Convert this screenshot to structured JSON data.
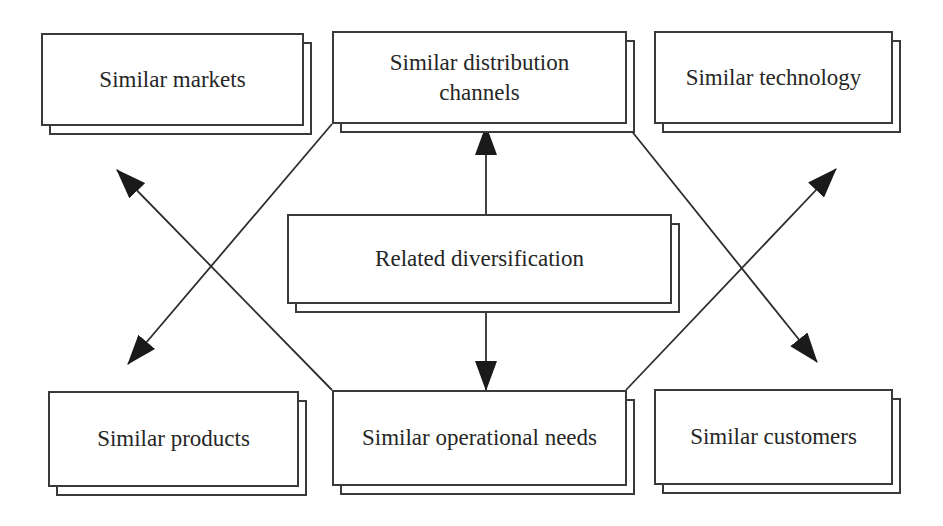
{
  "diagram": {
    "title": "Related diversification",
    "center": {
      "label": "Related diversification",
      "box": {
        "x": 287,
        "y": 214,
        "w": 385,
        "h": 90
      }
    },
    "nodes": [
      {
        "id": "similar-markets",
        "label": "Similar markets",
        "box": {
          "x": 41,
          "y": 33,
          "w": 263,
          "h": 93
        }
      },
      {
        "id": "similar-distribution-channels",
        "label": "Similar distribution\nchannels",
        "box": {
          "x": 332,
          "y": 31,
          "w": 295,
          "h": 93
        }
      },
      {
        "id": "similar-technology",
        "label": "Similar technology",
        "box": {
          "x": 654,
          "y": 31,
          "w": 239,
          "h": 93
        }
      },
      {
        "id": "similar-products",
        "label": "Similar products",
        "box": {
          "x": 48,
          "y": 391,
          "w": 251,
          "h": 96
        }
      },
      {
        "id": "similar-operational-needs",
        "label": "Similar operational needs",
        "box": {
          "x": 332,
          "y": 390,
          "w": 295,
          "h": 96
        }
      },
      {
        "id": "similar-customers",
        "label": "Similar customers",
        "box": {
          "x": 654,
          "y": 389,
          "w": 239,
          "h": 96
        }
      }
    ],
    "shadow_offset": {
      "dx": 8,
      "dy": 9
    },
    "connectors": [
      {
        "id": "center-to-channels",
        "from": "related-diversification",
        "to": "similar-distribution-channels",
        "x1": 486,
        "y1": 214,
        "x2": 486,
        "y2": 126
      },
      {
        "id": "center-to-operational",
        "from": "related-diversification",
        "to": "similar-operational-needs",
        "x1": 486,
        "y1": 311,
        "x2": 486,
        "y2": 390
      },
      {
        "id": "channels-to-products",
        "from": "similar-distribution-channels",
        "to": "similar-products",
        "x1": 332,
        "y1": 124,
        "x2": 128,
        "y2": 364
      },
      {
        "id": "operational-to-markets",
        "from": "similar-operational-needs",
        "to": "similar-markets",
        "x1": 332,
        "y1": 390,
        "x2": 117,
        "y2": 170
      },
      {
        "id": "channels-to-customers",
        "from": "similar-distribution-channels",
        "to": "similar-customers",
        "x1": 626,
        "y1": 124,
        "x2": 817,
        "y2": 362
      },
      {
        "id": "operational-to-technology",
        "from": "similar-operational-needs",
        "to": "similar-technology",
        "x1": 626,
        "y1": 390,
        "x2": 836,
        "y2": 169
      }
    ],
    "colors": {
      "line": "#2e2e2e",
      "text": "#262626",
      "background": "#ffffff"
    }
  }
}
